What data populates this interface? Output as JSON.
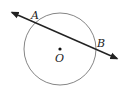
{
  "diagram": {
    "type": "circle-with-secant",
    "circle": {
      "center": [
        60,
        49
      ],
      "radius": 36,
      "stroke": "#777777"
    },
    "center_point": {
      "label": "O",
      "pos": [
        60,
        49
      ]
    },
    "line": {
      "from": [
        11,
        12
      ],
      "to": [
        118,
        59
      ],
      "arrows": "both",
      "stroke": "#222222"
    },
    "points": [
      {
        "label": "A",
        "label_pos": [
          31,
          19
        ]
      },
      {
        "label": "B",
        "label_pos": [
          97,
          47
        ]
      }
    ],
    "center_label": {
      "text": "O",
      "label_pos": [
        55,
        62
      ]
    }
  }
}
